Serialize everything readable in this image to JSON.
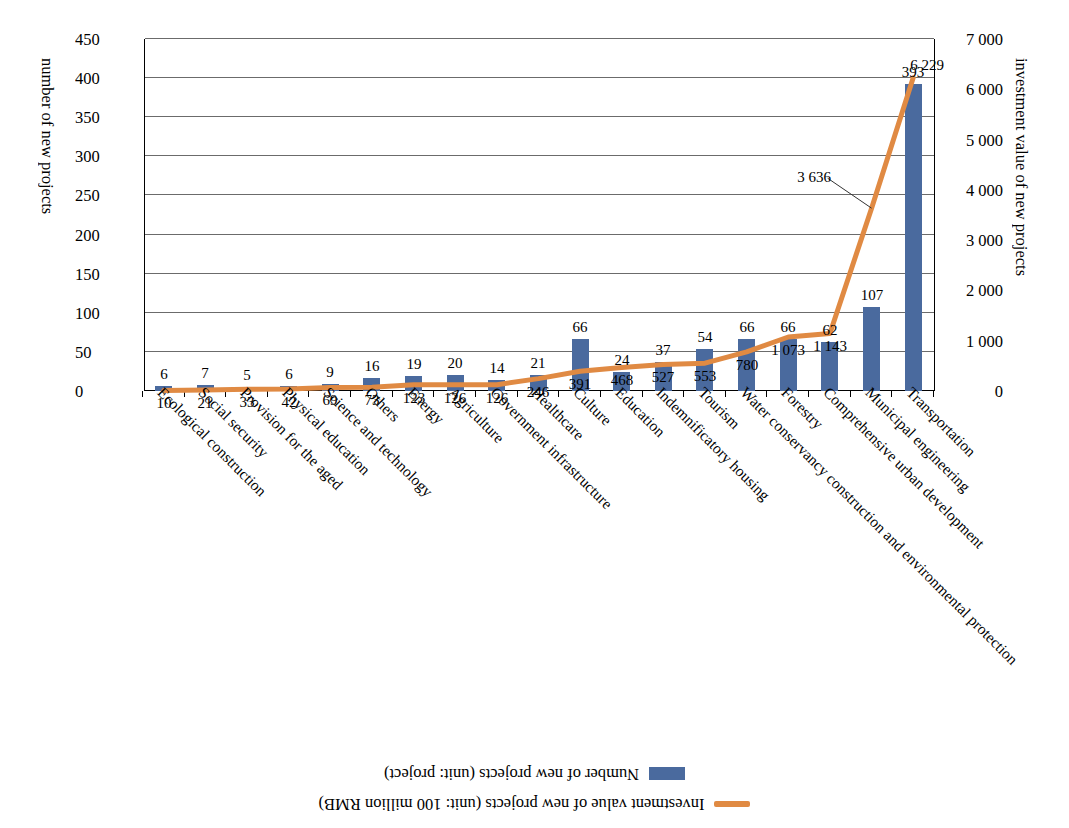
{
  "legend": {
    "items": [
      {
        "name": "investment-value-series",
        "label": "Investment value of new projects (unit: 100 million RMB)",
        "marker": "line",
        "color": "#e08a43"
      },
      {
        "name": "number-of-projects-series",
        "label": "Number of new projects (unit: project)",
        "marker": "bar",
        "color": "#4a6a9e"
      }
    ]
  },
  "axes": {
    "left": {
      "title": "investment value of new projects",
      "ticks": [
        "0",
        "1 000",
        "2 000",
        "3 000",
        "4 000",
        "5 000",
        "6 000",
        "7 000"
      ],
      "min": 0,
      "max": 7000
    },
    "right": {
      "title": "number of new projects",
      "ticks": [
        "0",
        "50",
        "100",
        "150",
        "200",
        "250",
        "300",
        "350",
        "400",
        "450"
      ],
      "min": 0,
      "max": 450
    }
  },
  "chart_data": {
    "type": "bar",
    "title": "",
    "xlabel": "",
    "ylabel": "investment value of new projects",
    "y2label": "number of new projects",
    "ylim": [
      0,
      7000
    ],
    "y2lim": [
      0,
      450
    ],
    "grid": true,
    "legend_position": "top",
    "orientation": "rotated-180",
    "categories": [
      "Transportation",
      "Municipal engineering",
      "Comprehensive urban development",
      "Forestry",
      "Water conservancy construction and environmental protection",
      "Tourism",
      "Indemnificatory housing",
      "Education",
      "Culture",
      "Healthcare",
      "Government infrastructure",
      "Agriculture",
      "Energy",
      "Others",
      "Science and technology",
      "Physical education",
      "Provision for the aged",
      "Social security",
      "Ecological construction"
    ],
    "series": [
      {
        "name": "Number of new projects (unit: project)",
        "type": "bar",
        "axis": "right",
        "color": "#4a6a9e",
        "values": [
          393,
          107,
          62,
          66,
          66,
          54,
          37,
          24,
          66,
          21,
          14,
          20,
          19,
          16,
          9,
          6,
          5,
          7,
          6
        ],
        "labels": [
          "393",
          "107",
          "62",
          "66",
          "66",
          "54",
          "37",
          "24",
          "66",
          "21",
          "14",
          "20",
          "19",
          "16",
          "9",
          "6",
          "5",
          "7",
          "6"
        ]
      },
      {
        "name": "Investment value of new projects (unit: 100 million RMB)",
        "type": "line",
        "axis": "left",
        "color": "#e08a43",
        "values": [
          6229,
          3636,
          1143,
          1073,
          780,
          553,
          527,
          468,
          391,
          246,
          126,
          126,
          123,
          73,
          69,
          42,
          33,
          21,
          10
        ],
        "labels": [
          "6 229",
          "3 636",
          "1 143",
          "1 073",
          "780",
          "553",
          "527",
          "468",
          "391",
          "246",
          "126",
          "126",
          "123",
          "73",
          "69",
          "42",
          "33",
          "21",
          "10"
        ]
      }
    ]
  }
}
